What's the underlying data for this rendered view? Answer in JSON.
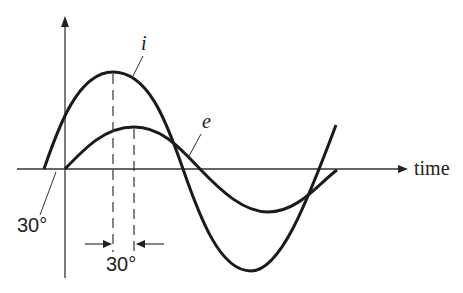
{
  "diagram": {
    "title": "",
    "curves": [
      {
        "name": "i",
        "label": "i",
        "description": "current sinusoid, larger amplitude, leading by 30°"
      },
      {
        "name": "e",
        "label": "e",
        "description": "voltage sinusoid, smaller amplitude"
      }
    ],
    "axes": {
      "horizontal_label": "time",
      "vertical_label": ""
    },
    "annotations": {
      "phase_offset_start": "30°",
      "phase_offset_peaks": "30°"
    },
    "colors": {
      "stroke": "#1a1a1a",
      "background": "#ffffff"
    }
  }
}
